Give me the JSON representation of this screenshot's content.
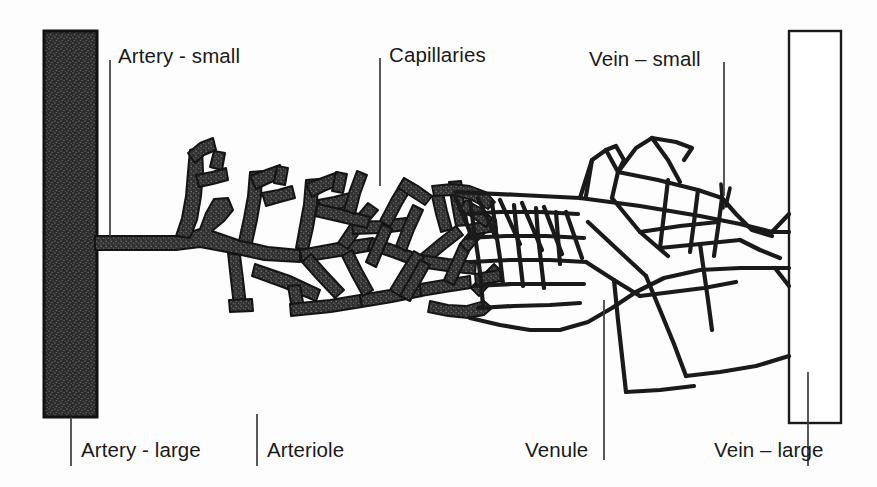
{
  "figure": {
    "background_color": "#fdfdfd",
    "ink_color": "#1a1a1a",
    "arterial_fill": "#2e2e2e",
    "venous_fill": "#ffffff"
  },
  "labels": {
    "artery_small": "Artery - small",
    "capillaries": "Capillaries",
    "vein_small": "Vein – small",
    "artery_large": "Artery - large",
    "arteriole": "Arteriole",
    "venule": "Venule",
    "vein_large": "Vein – large"
  },
  "structures": {
    "large_artery": "large-artery-trunk",
    "large_vein": "large-vein-trunk",
    "arterial_tree": "arterial-branching-tree",
    "capillary_bed": "capillary-network",
    "venous_tree": "venous-branching-tree"
  }
}
